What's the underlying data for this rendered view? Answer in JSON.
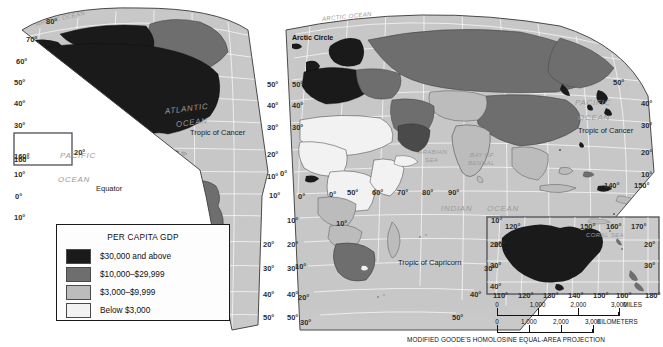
{
  "legend": {
    "title": "PER CAPITA GDP",
    "classes": [
      {
        "label": "$30,000 and above",
        "color": "#1a1a1a"
      },
      {
        "label": "$10,000–$29,999",
        "color": "#6e6e6e"
      },
      {
        "label": "$3,000–$9,999",
        "color": "#bcbcbc"
      },
      {
        "label": "Below $3,000",
        "color": "#f2f2f2"
      }
    ]
  },
  "projection_note": "MODIFIED GOODE'S HOMOLOSINE EQUAL-AREA PROJECTION",
  "scales": [
    {
      "unit": "MILES",
      "ticks": [
        "0",
        "1,000",
        "2,000",
        "3,000"
      ]
    },
    {
      "unit": "KILOMETERS",
      "ticks": [
        "0",
        "1,000",
        "2,000",
        "3,000"
      ]
    }
  ],
  "ocean_labels": [
    {
      "text": "ARCTIC OCEAN",
      "x": 36,
      "y": 21,
      "size": 6,
      "rot": -13
    },
    {
      "text": "ARCTIC OCEAN",
      "x": 322,
      "y": 16,
      "size": 6,
      "rot": -6
    },
    {
      "text": "ATLANTIC",
      "x": 165,
      "y": 107,
      "size": 8,
      "rot": -7
    },
    {
      "text": "OCEAN",
      "x": 176,
      "y": 120,
      "size": 8,
      "rot": -7
    },
    {
      "text": "PACIFIC",
      "x": 60,
      "y": 151,
      "size": 8,
      "rot": 0
    },
    {
      "text": "OCEAN",
      "x": 58,
      "y": 175,
      "size": 8,
      "rot": 0
    },
    {
      "text": "PACIFIC",
      "x": 575,
      "y": 98,
      "size": 8,
      "rot": 0
    },
    {
      "text": "OCEAN",
      "x": 578,
      "y": 113,
      "size": 8,
      "rot": 0
    },
    {
      "text": "INDIAN",
      "x": 441,
      "y": 204,
      "size": 8,
      "rot": 0
    },
    {
      "text": "OCEAN",
      "x": 487,
      "y": 204,
      "size": 8,
      "rot": 0
    },
    {
      "text": "ARABIAN",
      "x": 418,
      "y": 149,
      "size": 6,
      "rot": 0
    },
    {
      "text": "SEA",
      "x": 425,
      "y": 157,
      "size": 6,
      "rot": 0
    },
    {
      "text": "BAY OF",
      "x": 470,
      "y": 152,
      "size": 6,
      "rot": 0
    },
    {
      "text": "BENGAL",
      "x": 468,
      "y": 160,
      "size": 6,
      "rot": 0
    },
    {
      "text": "CORAL SEA",
      "x": 586,
      "y": 232,
      "size": 6,
      "rot": 0
    }
  ],
  "reference_lines": [
    {
      "text": "Arctic Circle",
      "x": 292,
      "y": 34
    },
    {
      "text": "Equator",
      "x": 96,
      "y": 184
    },
    {
      "text": "Tropic of Cancer",
      "x": 190,
      "y": 128
    },
    {
      "text": "Tropic of Cancer",
      "x": 578,
      "y": 126
    },
    {
      "text": "Tropic of Capricorn",
      "x": 398,
      "y": 258
    }
  ],
  "latitude_labels": [
    {
      "text": "80°",
      "x": 46,
      "y": 17
    },
    {
      "text": "70°",
      "x": 26,
      "y": 35
    },
    {
      "text": "60°",
      "x": 16,
      "y": 57
    },
    {
      "text": "50°",
      "x": 14,
      "y": 78
    },
    {
      "text": "40°",
      "x": 14,
      "y": 99
    },
    {
      "text": "30°",
      "x": 14,
      "y": 121
    },
    {
      "text": "20°",
      "x": 74,
      "y": 148
    },
    {
      "text": "10°",
      "x": 14,
      "y": 170
    },
    {
      "text": "0°",
      "x": 15,
      "y": 192
    },
    {
      "text": "10°",
      "x": 14,
      "y": 213
    },
    {
      "text": "50°",
      "x": 267,
      "y": 80
    },
    {
      "text": "40°",
      "x": 267,
      "y": 101
    },
    {
      "text": "30°",
      "x": 267,
      "y": 123
    },
    {
      "text": "20°",
      "x": 267,
      "y": 150
    },
    {
      "text": "10°",
      "x": 267,
      "y": 172
    },
    {
      "text": "50°",
      "x": 292,
      "y": 80
    },
    {
      "text": "40°",
      "x": 292,
      "y": 101
    },
    {
      "text": "30°",
      "x": 292,
      "y": 123
    },
    {
      "text": "0°",
      "x": 280,
      "y": 169
    },
    {
      "text": "0°",
      "x": 329,
      "y": 190
    },
    {
      "text": "10°",
      "x": 336,
      "y": 219
    },
    {
      "text": "10°",
      "x": 287,
      "y": 216
    },
    {
      "text": "20°",
      "x": 287,
      "y": 240
    },
    {
      "text": "20°",
      "x": 263,
      "y": 240
    },
    {
      "text": "30°",
      "x": 287,
      "y": 264
    },
    {
      "text": "30°",
      "x": 263,
      "y": 264
    },
    {
      "text": "40°",
      "x": 287,
      "y": 290
    },
    {
      "text": "40°",
      "x": 263,
      "y": 290
    },
    {
      "text": "50°",
      "x": 287,
      "y": 313
    },
    {
      "text": "50°",
      "x": 263,
      "y": 313
    },
    {
      "text": "50°",
      "x": 613,
      "y": 78
    },
    {
      "text": "40°",
      "x": 641,
      "y": 99
    },
    {
      "text": "30°",
      "x": 641,
      "y": 121
    },
    {
      "text": "20°",
      "x": 641,
      "y": 148
    },
    {
      "text": "10°",
      "x": 641,
      "y": 170
    },
    {
      "text": "10°",
      "x": 295,
      "y": 262
    },
    {
      "text": "20°",
      "x": 298,
      "y": 293
    },
    {
      "text": "30°",
      "x": 300,
      "y": 318
    },
    {
      "text": "10°",
      "x": 491,
      "y": 216
    },
    {
      "text": "20°",
      "x": 494,
      "y": 240
    },
    {
      "text": "30°",
      "x": 484,
      "y": 264
    },
    {
      "text": "40°",
      "x": 470,
      "y": 290
    },
    {
      "text": "50°",
      "x": 452,
      "y": 313
    },
    {
      "text": "160°",
      "x": 14,
      "y": 155
    }
  ],
  "longitude_labels": [
    {
      "text": "140°",
      "x": 604,
      "y": 181
    },
    {
      "text": "150°",
      "x": 634,
      "y": 181
    },
    {
      "text": "10°",
      "x": 269,
      "y": 191
    },
    {
      "text": "50°",
      "x": 347,
      "y": 188
    },
    {
      "text": "60°",
      "x": 372,
      "y": 188
    },
    {
      "text": "70°",
      "x": 397,
      "y": 188
    },
    {
      "text": "80°",
      "x": 422,
      "y": 188
    },
    {
      "text": "90°",
      "x": 448,
      "y": 188
    },
    {
      "text": "0°",
      "x": 298,
      "y": 192
    }
  ],
  "australia_inset": {
    "top_labels": [
      {
        "text": "120°",
        "x": 505,
        "y": 222
      },
      {
        "text": "150°",
        "x": 580,
        "y": 222
      },
      {
        "text": "160°",
        "x": 606,
        "y": 222
      },
      {
        "text": "170°",
        "x": 631,
        "y": 222
      }
    ],
    "bottom_labels": [
      {
        "text": "110°",
        "x": 493,
        "y": 291
      },
      {
        "text": "120°",
        "x": 518,
        "y": 291
      },
      {
        "text": "130°",
        "x": 543,
        "y": 291
      },
      {
        "text": "140°",
        "x": 568,
        "y": 291
      },
      {
        "text": "150°",
        "x": 593,
        "y": 291
      },
      {
        "text": "160°",
        "x": 616,
        "y": 291
      },
      {
        "text": "180°",
        "x": 645,
        "y": 291
      }
    ],
    "side_labels": [
      {
        "text": "20°",
        "x": 490,
        "y": 240
      },
      {
        "text": "30°",
        "x": 490,
        "y": 261
      },
      {
        "text": "40°",
        "x": 490,
        "y": 282
      },
      {
        "text": "20°",
        "x": 644,
        "y": 240
      },
      {
        "text": "30°",
        "x": 644,
        "y": 261
      }
    ]
  },
  "hawaii_inset": {
    "lon": "160°",
    "lat": "20°"
  }
}
